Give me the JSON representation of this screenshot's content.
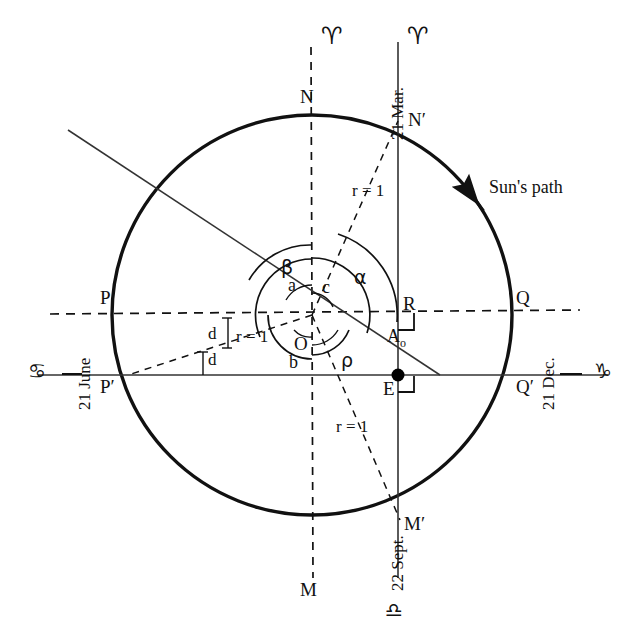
{
  "figure": {
    "type": "astronomical-diagram",
    "title_text": "Sun's path"
  },
  "circle": {
    "name": "suns-path-circle",
    "center": {
      "x": 312,
      "y": 315
    },
    "radius": 200,
    "path_label": "Sun's path",
    "direction": "counterclockwise"
  },
  "axis_labels": {
    "aries_left": "♈",
    "aries_right": "♈",
    "cancer": "♋",
    "capricorn": "♑",
    "libra": "♎"
  },
  "dates": {
    "mar": "21 Mar.",
    "june": "21 June",
    "dec": "21 Dec.",
    "sept": "22 Sept."
  },
  "points": [
    {
      "id": "N",
      "label": "N",
      "x": 300,
      "y": 96
    },
    {
      "id": "N_prime",
      "label": "N′",
      "x": 408,
      "y": 121
    },
    {
      "id": "P",
      "label": "P",
      "x": 100,
      "y": 297
    },
    {
      "id": "P_prime",
      "label": "P′",
      "x": 102,
      "y": 388
    },
    {
      "id": "Q",
      "label": "Q",
      "x": 516,
      "y": 298
    },
    {
      "id": "Q_prime",
      "label": "Q′",
      "x": 518,
      "y": 388
    },
    {
      "id": "R",
      "label": "R",
      "x": 403,
      "y": 303
    },
    {
      "id": "E",
      "label": "E",
      "x": 394,
      "y": 388
    },
    {
      "id": "O",
      "label": "O",
      "x": 299,
      "y": 344
    },
    {
      "id": "M",
      "label": "M",
      "x": 300,
      "y": 589
    },
    {
      "id": "M_prime",
      "label": "M′",
      "x": 406,
      "y": 525
    },
    {
      "id": "A_o",
      "label": "A",
      "sub": "o",
      "x": 392,
      "y": 336
    }
  ],
  "angle_labels": [
    {
      "id": "alpha",
      "label": "α",
      "x": 354,
      "y": 277
    },
    {
      "id": "beta",
      "label": "β",
      "x": 283,
      "y": 268
    },
    {
      "id": "a",
      "label": "a",
      "x": 290,
      "y": 283
    },
    {
      "id": "c",
      "label": "c",
      "x": 322,
      "y": 285
    },
    {
      "id": "b",
      "label": "b",
      "x": 291,
      "y": 362
    },
    {
      "id": "rho",
      "label": "ρ",
      "x": 343,
      "y": 360
    }
  ],
  "measure_labels": [
    {
      "id": "r1-upper",
      "label": "r = 1",
      "x": 355,
      "y": 191
    },
    {
      "id": "r1-left",
      "label": "r = 1",
      "x": 239,
      "y": 337
    },
    {
      "id": "r1-lower",
      "label": "r = 1",
      "x": 339,
      "y": 427
    },
    {
      "id": "d-upper",
      "label": "d",
      "x": 209,
      "y": 334
    },
    {
      "id": "d-lower",
      "label": "d",
      "x": 209,
      "y": 360
    }
  ],
  "colors": {
    "stroke": "#111111",
    "background": "#ffffff",
    "point_fill": "#000000"
  }
}
